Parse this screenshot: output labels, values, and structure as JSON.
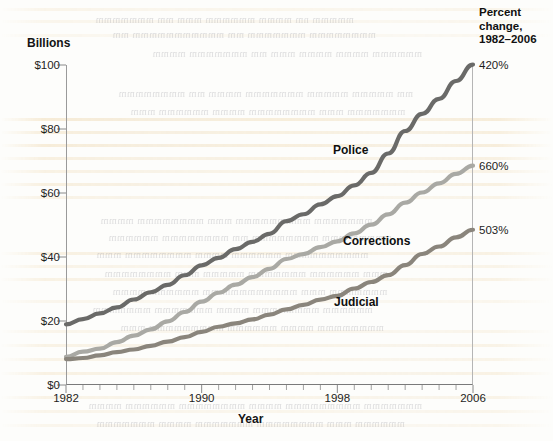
{
  "axis": {
    "y_title": "Billions",
    "x_title": "Year",
    "y_ticks": [
      "$0",
      "$20",
      "$40",
      "$60",
      "$80",
      "$100"
    ],
    "x_ticks": [
      "1982",
      "1990",
      "1998",
      "2006"
    ]
  },
  "right_header": {
    "line1": "Percent",
    "line2": "change,",
    "line3": "1982–2006"
  },
  "series_labels": {
    "police": "Police",
    "corrections": "Corrections",
    "judicial": "Judicial"
  },
  "percent_change": {
    "police": "420%",
    "corrections": "660%",
    "judicial": "503%"
  },
  "colors": {
    "police": "#6a6a68",
    "corrections": "#a9a9a4",
    "judicial": "#8a857c",
    "axis": "#8a8a8a",
    "text": "#1a1a1a",
    "bleed": "#e2b76a"
  },
  "chart_data": {
    "type": "line",
    "title": "",
    "subtitle": "",
    "xlabel": "Year",
    "ylabel": "Billions",
    "xlim": [
      1982,
      2006
    ],
    "ylim": [
      0,
      100
    ],
    "grid": false,
    "legend_position": "inline-labels",
    "x": [
      1982,
      1983,
      1984,
      1985,
      1986,
      1987,
      1988,
      1989,
      1990,
      1991,
      1992,
      1993,
      1994,
      1995,
      1996,
      1997,
      1998,
      1999,
      2000,
      2001,
      2002,
      2003,
      2004,
      2005,
      2006
    ],
    "x_tick_labels": [
      "1982",
      "1990",
      "1998",
      "2006"
    ],
    "y_tick_values": [
      0,
      20,
      40,
      60,
      80,
      100
    ],
    "y_tick_labels": [
      "$0",
      "$20",
      "$40",
      "$60",
      "$80",
      "$100"
    ],
    "series": [
      {
        "name": "Police",
        "color": "#6a6a68",
        "percent_change_1982_2006": "420%",
        "label_position": "above-line",
        "values": [
          19.0,
          20.5,
          22.4,
          24.5,
          26.8,
          29.0,
          31.5,
          34.5,
          37.2,
          40.0,
          42.3,
          44.6,
          47.5,
          51.0,
          53.3,
          56.2,
          58.8,
          62.5,
          66.5,
          72.5,
          79.5,
          84.5,
          89.5,
          95.0,
          100.0
        ]
      },
      {
        "name": "Corrections",
        "color": "#a9a9a4",
        "percent_change_1982_2006": "660%",
        "label_position": "above-line",
        "values": [
          9.0,
          10.2,
          11.5,
          13.2,
          15.2,
          17.5,
          20.0,
          23.0,
          26.2,
          29.0,
          31.5,
          33.5,
          36.2,
          39.2,
          41.0,
          43.0,
          44.8,
          47.5,
          50.0,
          53.5,
          57.0,
          60.0,
          63.0,
          66.0,
          68.5
        ]
      },
      {
        "name": "Judicial",
        "color": "#8a857c",
        "percent_change_1982_2006": "503%",
        "label_position": "below-line",
        "values": [
          8.0,
          8.6,
          9.3,
          10.2,
          11.2,
          12.3,
          13.5,
          15.0,
          16.5,
          18.0,
          19.3,
          20.5,
          22.0,
          23.5,
          25.0,
          26.5,
          28.0,
          30.0,
          32.0,
          34.5,
          37.5,
          41.0,
          43.5,
          46.0,
          48.5
        ]
      }
    ]
  }
}
